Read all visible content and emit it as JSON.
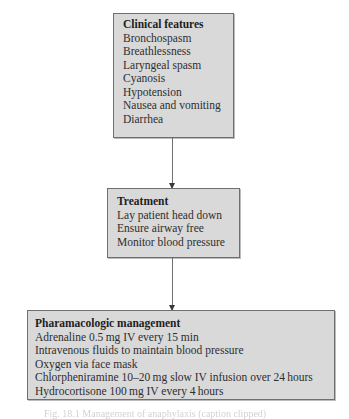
{
  "diagram": {
    "type": "flowchart",
    "nodes": [
      {
        "id": "clinical",
        "title": "Clinical features",
        "items": [
          "Bronchospasm",
          "Breathlessness",
          "Laryngeal spasm",
          "Cyanosis",
          "Hypotension",
          "Nausea and vomiting",
          "Diarrhea"
        ]
      },
      {
        "id": "treatment",
        "title": "Treatment",
        "items": [
          "Lay patient head down",
          "Ensure airway free",
          "Monitor blood pressure"
        ]
      },
      {
        "id": "pharma",
        "title": "Pharamacologic management",
        "items": [
          "Adrenaline 0.5 mg IV every 15 min",
          "Intravenous fluids to maintain blood pressure",
          "Oxygen via face mask",
          "Chlorpheniramine 10–20 mg slow IV infusion over 24 hours",
          "Hydrocortisone 100 mg IV every 4 hours"
        ]
      }
    ],
    "edges": [
      {
        "from": "clinical",
        "to": "treatment"
      },
      {
        "from": "treatment",
        "to": "pharma"
      }
    ],
    "colors": {
      "box_fill": "#d9d9d9",
      "box_border": "#6f6f6f",
      "arrow": "#6f6f6f"
    },
    "caption": "Fig. 18.1 Management of anaphylaxis (caption clipped)"
  }
}
